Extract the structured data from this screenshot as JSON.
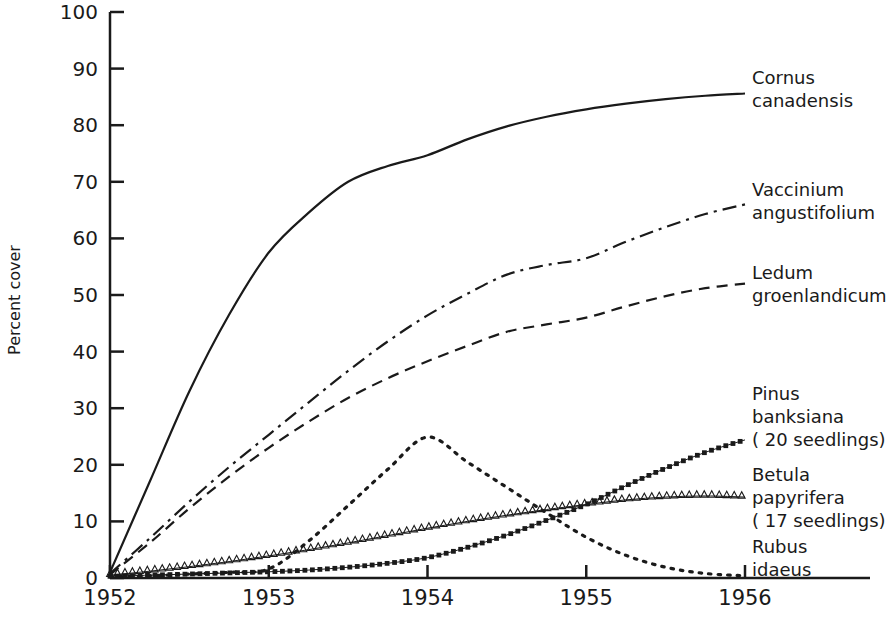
{
  "chart_data": {
    "type": "line",
    "title": "",
    "xlabel": "",
    "ylabel": "Percent cover",
    "xlim": [
      1952,
      1956
    ],
    "ylim": [
      0,
      100
    ],
    "grid": false,
    "legend_position": "right-inline",
    "xticks": [
      "1952",
      "1953",
      "1954",
      "1955",
      "1956"
    ],
    "yticks": [
      "0",
      "10",
      "20",
      "30",
      "40",
      "50",
      "60",
      "70",
      "80",
      "90",
      "100"
    ],
    "x": [
      1952,
      1952.25,
      1952.5,
      1952.75,
      1953,
      1953.25,
      1953.5,
      1953.75,
      1954,
      1954.25,
      1954.5,
      1954.75,
      1955,
      1955.25,
      1955.5,
      1955.75,
      1956
    ],
    "series": [
      {
        "name": "Cornus canadensis",
        "label_line1": "Cornus",
        "label_line2": "canadensis",
        "label_line3": "",
        "style": "solid",
        "marker": "none",
        "values": [
          1.0,
          17.0,
          33.0,
          46.5,
          57.5,
          64.5,
          70.0,
          72.8,
          74.7,
          77.5,
          79.8,
          81.5,
          82.8,
          83.8,
          84.6,
          85.2,
          85.6
        ]
      },
      {
        "name": "Vaccinium angustifolium",
        "label_line1": "Vaccinium",
        "label_line2": "angustifolium",
        "label_line3": "",
        "style": "dashdot",
        "marker": "none",
        "values": [
          0.8,
          7.0,
          13.5,
          19.6,
          25.3,
          31.0,
          36.6,
          41.8,
          46.4,
          50.2,
          53.6,
          55.3,
          56.5,
          59.4,
          62.0,
          64.3,
          66.0
        ]
      },
      {
        "name": "Ledum groenlandicum",
        "label_line1": "Ledum",
        "label_line2": "groenlandicum",
        "label_line3": "",
        "style": "dashed",
        "marker": "none",
        "values": [
          0.6,
          6.2,
          12.3,
          17.9,
          23.0,
          27.6,
          31.8,
          35.3,
          38.3,
          41.0,
          43.5,
          44.8,
          46.0,
          48.0,
          49.8,
          51.2,
          52.0
        ]
      },
      {
        "name": "Pinus banksiana (20 seedlings)",
        "label_line1": "Pinus",
        "label_line2": "banksiana",
        "label_line3": "( 20 seedlings)",
        "style": "dotted-square",
        "marker": "square",
        "values": [
          0.3,
          0.5,
          0.7,
          0.9,
          1.1,
          1.4,
          1.9,
          2.6,
          3.6,
          5.4,
          7.6,
          10.2,
          13.0,
          16.3,
          19.4,
          22.2,
          24.4
        ]
      },
      {
        "name": "Betula papyrifera (17 seedlings)",
        "label_line1": "Betula",
        "label_line2": "papyrifera",
        "label_line3": "( 17 seedlings)",
        "style": "dotted-triangle",
        "marker": "triangle",
        "values": [
          0.5,
          1.2,
          2.0,
          2.9,
          3.9,
          5.0,
          6.2,
          7.5,
          8.8,
          10.0,
          11.1,
          12.1,
          13.0,
          13.8,
          14.3,
          14.5,
          14.3
        ]
      },
      {
        "name": "Rubus idaeus",
        "label_line1": "Rubus",
        "label_line2": "idaeus",
        "label_line3": "",
        "style": "dotted",
        "marker": "none",
        "values": [
          0.2,
          0.4,
          0.7,
          1.0,
          1.6,
          6.5,
          12.8,
          19.2,
          24.9,
          20.5,
          16.0,
          11.5,
          7.2,
          4.0,
          1.9,
          0.8,
          0.4
        ]
      }
    ]
  }
}
